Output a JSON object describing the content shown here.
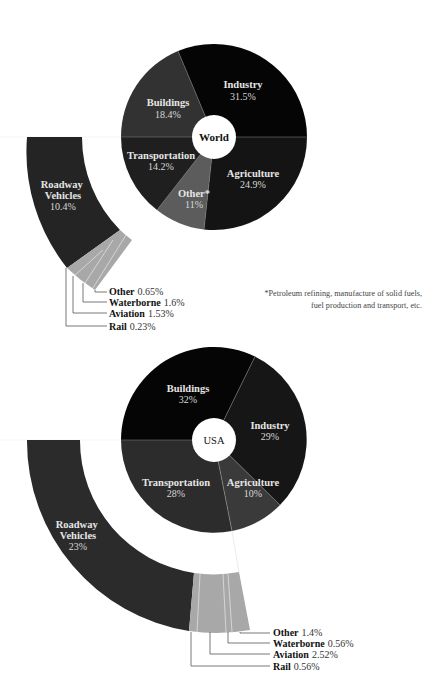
{
  "footnote": "*Petroleum refining, manufacture of solid fuels, fuel production and transport, etc.",
  "colors": {
    "black": "#070707",
    "dark": "#1c1c1c",
    "mid": "#2f2f2f",
    "gray": "#5a5a5a",
    "light": "#a9a9a9",
    "ring": "#2a2a2a",
    "line": "#666666",
    "white": "#ffffff"
  },
  "chart_data": [
    {
      "type": "pie",
      "title": "World",
      "center_label": "World",
      "slices": [
        {
          "label": "Industry",
          "value": 31.5,
          "display": "31.5%"
        },
        {
          "label": "Agriculture",
          "value": 24.9,
          "display": "24.9%"
        },
        {
          "label": "Other*",
          "value": 11,
          "display": "11%"
        },
        {
          "label": "Transportation",
          "value": 14.2,
          "display": "14.2%"
        },
        {
          "label": "Buildings",
          "value": 18.4,
          "display": "18.4%"
        }
      ],
      "breakdown_of": "Transportation",
      "breakdown": [
        {
          "label": "Roadway Vehicles",
          "value": 10.4,
          "display": "10.4%"
        },
        {
          "label": "Other",
          "value": 0.65,
          "display": "0.65%"
        },
        {
          "label": "Waterborne",
          "value": 1.6,
          "display": "1.6%"
        },
        {
          "label": "Aviation",
          "value": 1.53,
          "display": "1.53%"
        },
        {
          "label": "Rail",
          "value": 0.23,
          "display": "0.23%"
        }
      ]
    },
    {
      "type": "pie",
      "title": "USA",
      "center_label": "USA",
      "slices": [
        {
          "label": "Buildings",
          "value": 32,
          "display": "32%"
        },
        {
          "label": "Industry",
          "value": 29,
          "display": "29%"
        },
        {
          "label": "Agriculture",
          "value": 10,
          "display": "10%"
        },
        {
          "label": "Transportation",
          "value": 28,
          "display": "28%"
        }
      ],
      "breakdown_of": "Transportation",
      "breakdown": [
        {
          "label": "Roadway Vehicles",
          "value": 23,
          "display": "23%"
        },
        {
          "label": "Other",
          "value": 1.4,
          "display": "1.4%"
        },
        {
          "label": "Waterborne",
          "value": 0.56,
          "display": "0.56%"
        },
        {
          "label": "Aviation",
          "value": 2.52,
          "display": "2.52%"
        },
        {
          "label": "Rail",
          "value": 0.56,
          "display": "0.56%"
        }
      ]
    }
  ]
}
